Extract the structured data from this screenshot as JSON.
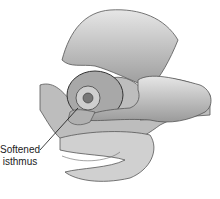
{
  "figure": {
    "annotation": {
      "line1": "Softened",
      "line2": "isthmus"
    }
  }
}
